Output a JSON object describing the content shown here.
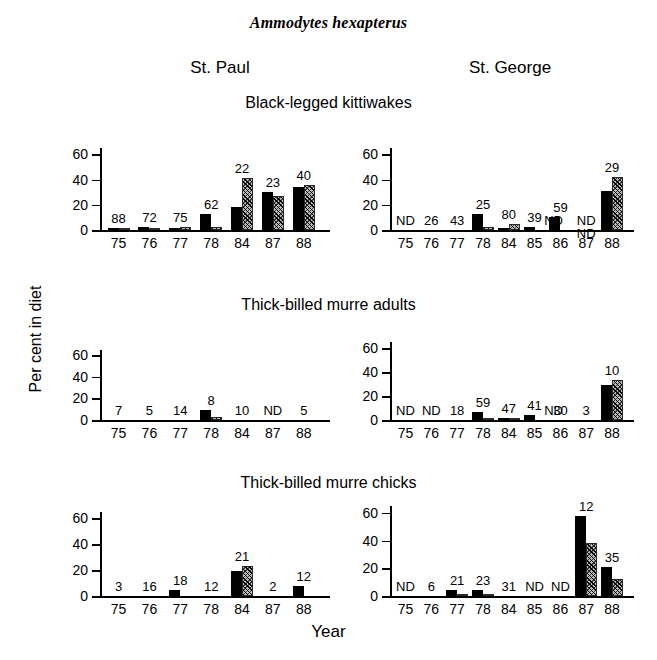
{
  "figure": {
    "species_title": "Ammodytes hexapterus",
    "column_headers": [
      "St. Paul",
      "St. George"
    ],
    "row_titles": [
      "Black-legged kittiwakes",
      "Thick-billed murre adults",
      "Thick-billed murre chicks"
    ],
    "y_axis_title": "Per cent in diet",
    "x_axis_title": "Year",
    "no_data_text": "ND"
  },
  "chart_data": [
    {
      "type": "bar",
      "title": "Black-legged kittiwakes",
      "colony": "St. Paul",
      "xlabel": "Year",
      "ylabel": "Per cent in diet",
      "ylim": [
        0,
        65
      ],
      "yticks": [
        0,
        20,
        40,
        60
      ],
      "grid": false,
      "legend": false,
      "categories": [
        "75",
        "76",
        "77",
        "78",
        "84",
        "87",
        "88"
      ],
      "series": [
        {
          "name": "occurrence",
          "fill": "solid-black",
          "values": [
            1.5,
            2,
            1,
            13,
            18,
            30,
            34
          ]
        },
        {
          "name": "numbers",
          "fill": "gray-hatch",
          "values": [
            1.5,
            1.5,
            2,
            2,
            41,
            27,
            36
          ]
        }
      ],
      "annotations": [
        "88",
        "72",
        "75",
        "62",
        "22",
        "23",
        "40"
      ],
      "nd_flags": [
        false,
        false,
        false,
        false,
        false,
        false,
        false
      ]
    },
    {
      "type": "bar",
      "title": "Black-legged kittiwakes",
      "colony": "St. George",
      "xlabel": "Year",
      "ylabel": "Per cent in diet",
      "ylim": [
        0,
        65
      ],
      "yticks": [
        0,
        20,
        40,
        60
      ],
      "grid": false,
      "legend": false,
      "categories": [
        "75",
        "76",
        "77",
        "78",
        "84",
        "85",
        "86",
        "87",
        "88"
      ],
      "series": [
        {
          "name": "occurrence",
          "fill": "solid-black",
          "values": [
            0,
            0,
            0,
            13,
            1.5,
            2,
            10,
            0,
            31
          ]
        },
        {
          "name": "numbers",
          "fill": "gray-hatch",
          "values": [
            0,
            0,
            0,
            2,
            5,
            0,
            0,
            0,
            42
          ]
        }
      ],
      "annotations": [
        "ND",
        "26",
        "43",
        "25",
        "80",
        "39",
        "59",
        "ND ND",
        "29"
      ],
      "nd_flags": [
        true,
        false,
        false,
        false,
        false,
        true,
        false,
        true,
        false
      ],
      "extra_nd": [
        "85"
      ]
    },
    {
      "type": "bar",
      "title": "Thick-billed murre adults",
      "colony": "St. Paul",
      "xlabel": "Year",
      "ylabel": "Per cent in diet",
      "ylim": [
        0,
        65
      ],
      "yticks": [
        0,
        20,
        40,
        60
      ],
      "grid": false,
      "legend": false,
      "categories": [
        "75",
        "76",
        "77",
        "78",
        "84",
        "87",
        "88"
      ],
      "series": [
        {
          "name": "occurrence",
          "fill": "solid-black",
          "values": [
            0,
            0,
            0,
            9,
            0,
            0,
            0
          ]
        },
        {
          "name": "numbers",
          "fill": "gray-hatch",
          "values": [
            0,
            0,
            0,
            2.5,
            0,
            0,
            0
          ]
        }
      ],
      "annotations": [
        "7",
        "5",
        "14",
        "8",
        "10",
        "ND",
        "5"
      ],
      "nd_flags": [
        false,
        false,
        false,
        false,
        false,
        true,
        false
      ]
    },
    {
      "type": "bar",
      "title": "Thick-billed murre adults",
      "colony": "St. George",
      "xlabel": "Year",
      "ylabel": "Per cent in diet",
      "ylim": [
        0,
        65
      ],
      "yticks": [
        0,
        20,
        40,
        60
      ],
      "grid": false,
      "legend": false,
      "categories": [
        "75",
        "76",
        "77",
        "78",
        "84",
        "85",
        "86",
        "87",
        "88"
      ],
      "series": [
        {
          "name": "occurrence",
          "fill": "solid-black",
          "values": [
            0,
            0,
            0,
            7,
            2,
            4,
            0,
            0,
            29
          ]
        },
        {
          "name": "numbers",
          "fill": "gray-hatch",
          "values": [
            0,
            0,
            0,
            1,
            1.5,
            0,
            0,
            0,
            33
          ]
        }
      ],
      "annotations": [
        "ND",
        "ND",
        "18",
        "59",
        "47",
        "41",
        "30",
        "3",
        "10"
      ],
      "nd_flags": [
        true,
        true,
        false,
        false,
        false,
        true,
        false,
        false,
        false
      ]
    },
    {
      "type": "bar",
      "title": "Thick-billed murre chicks",
      "colony": "St. Paul",
      "xlabel": "Year",
      "ylabel": "Per cent in diet",
      "ylim": [
        0,
        65
      ],
      "yticks": [
        0,
        20,
        40,
        60
      ],
      "grid": false,
      "legend": false,
      "categories": [
        "75",
        "76",
        "77",
        "78",
        "84",
        "87",
        "88"
      ],
      "series": [
        {
          "name": "occurrence",
          "fill": "solid-black",
          "values": [
            0,
            0,
            5,
            0,
            19,
            0,
            8
          ]
        },
        {
          "name": "numbers",
          "fill": "gray-hatch",
          "values": [
            0,
            0,
            0,
            0,
            23,
            0,
            0
          ]
        }
      ],
      "annotations": [
        "3",
        "16",
        "18",
        "12",
        "21",
        "2",
        "12"
      ],
      "nd_flags": [
        false,
        false,
        false,
        false,
        false,
        false,
        false
      ]
    },
    {
      "type": "bar",
      "title": "Thick-billed murre chicks",
      "colony": "St. George",
      "xlabel": "Year",
      "ylabel": "Per cent in diet",
      "ylim": [
        0,
        65
      ],
      "yticks": [
        0,
        20,
        40,
        60
      ],
      "grid": false,
      "legend": false,
      "categories": [
        "75",
        "76",
        "77",
        "78",
        "84",
        "85",
        "86",
        "87",
        "88"
      ],
      "series": [
        {
          "name": "occurrence",
          "fill": "solid-black",
          "values": [
            0,
            0,
            4,
            4,
            0,
            0,
            0,
            58,
            21
          ]
        },
        {
          "name": "numbers",
          "fill": "gray-hatch",
          "values": [
            0,
            0,
            1,
            1.5,
            0,
            0,
            0,
            38,
            12
          ]
        }
      ],
      "annotations": [
        "ND",
        "6",
        "21",
        "23",
        "31",
        "ND",
        "ND",
        "12",
        "35"
      ],
      "nd_flags": [
        true,
        false,
        false,
        false,
        false,
        true,
        true,
        false,
        false
      ]
    }
  ]
}
